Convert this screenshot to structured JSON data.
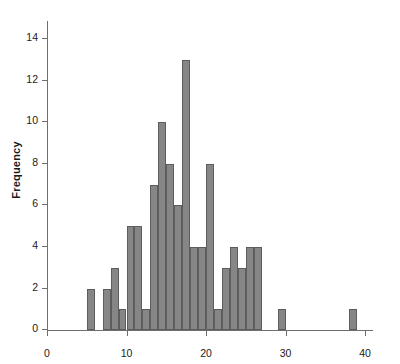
{
  "chart_data": {
    "type": "bar",
    "title": "",
    "subtitle": "",
    "xlabel": "",
    "ylabel": "Frequency",
    "grid": false,
    "legend": false,
    "bin_width": 1,
    "xlim": [
      0,
      41
    ],
    "ylim": [
      0,
      14.6
    ],
    "x_ticks": [
      0,
      10,
      20,
      30,
      40
    ],
    "x_tick_labels": [
      "0",
      "10",
      "20",
      "30",
      "40"
    ],
    "y_ticks": [
      0,
      2,
      4,
      6,
      8,
      10,
      12,
      14
    ],
    "y_tick_labels": [
      "0",
      "2",
      "4",
      "6",
      "8",
      "10",
      "12",
      "14"
    ],
    "bar_color": "#868686",
    "bar_edge_color": "#5d5d5d",
    "axis_color": "#6e6e6e",
    "text_color": "#1a1a1a",
    "background": "#ffffff",
    "categories": [
      5,
      6,
      7,
      8,
      9,
      10,
      11,
      12,
      13,
      14,
      15,
      16,
      17,
      18,
      19,
      20,
      21,
      22,
      23,
      24,
      25,
      26,
      27,
      28,
      29,
      30,
      31,
      32,
      33,
      34,
      35,
      36,
      37,
      38,
      39,
      40
    ],
    "values": [
      2,
      0,
      2,
      3,
      1,
      5,
      5,
      1,
      7,
      10,
      8,
      6,
      13,
      4,
      4,
      8,
      1,
      3,
      4,
      3,
      4,
      4,
      0,
      0,
      1,
      0,
      0,
      0,
      0,
      0,
      0,
      0,
      0,
      1,
      0,
      0
    ],
    "bins": [
      {
        "start": 5,
        "end": 6,
        "count": 2
      },
      {
        "start": 6,
        "end": 7,
        "count": 0
      },
      {
        "start": 7,
        "end": 8,
        "count": 2
      },
      {
        "start": 8,
        "end": 9,
        "count": 3
      },
      {
        "start": 9,
        "end": 10,
        "count": 1
      },
      {
        "start": 10,
        "end": 11,
        "count": 5
      },
      {
        "start": 11,
        "end": 12,
        "count": 5
      },
      {
        "start": 12,
        "end": 13,
        "count": 1
      },
      {
        "start": 13,
        "end": 14,
        "count": 7
      },
      {
        "start": 14,
        "end": 15,
        "count": 10
      },
      {
        "start": 15,
        "end": 16,
        "count": 8
      },
      {
        "start": 16,
        "end": 17,
        "count": 6
      },
      {
        "start": 17,
        "end": 18,
        "count": 13
      },
      {
        "start": 18,
        "end": 19,
        "count": 4
      },
      {
        "start": 19,
        "end": 20,
        "count": 4
      },
      {
        "start": 20,
        "end": 21,
        "count": 8
      },
      {
        "start": 21,
        "end": 22,
        "count": 1
      },
      {
        "start": 22,
        "end": 23,
        "count": 3
      },
      {
        "start": 23,
        "end": 24,
        "count": 4
      },
      {
        "start": 24,
        "end": 25,
        "count": 3
      },
      {
        "start": 25,
        "end": 26,
        "count": 4
      },
      {
        "start": 26,
        "end": 27,
        "count": 4
      },
      {
        "start": 29,
        "end": 30,
        "count": 1
      },
      {
        "start": 38,
        "end": 39,
        "count": 1
      }
    ]
  }
}
